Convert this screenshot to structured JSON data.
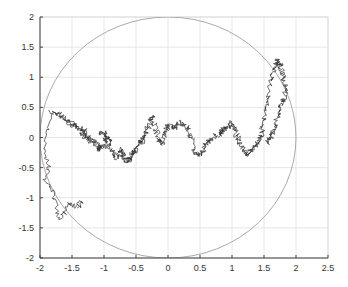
{
  "chart_data": {
    "type": "line",
    "title": "",
    "xlabel": "",
    "ylabel": "",
    "xlim": [
      -2,
      2.5
    ],
    "ylim": [
      -2,
      2
    ],
    "grid": true,
    "legend": null,
    "x_ticks": [
      -2,
      -1.5,
      -1,
      -0.5,
      0,
      0.5,
      1,
      1.5,
      2,
      2.5
    ],
    "x_tick_labels": [
      "-2",
      "-1.5",
      "-1",
      "-0.5",
      "0",
      "0.5",
      "1",
      "1.5",
      "2",
      "2.5"
    ],
    "y_ticks": [
      -2,
      -1.5,
      -1,
      -0.5,
      0,
      0.5,
      1,
      1.5,
      2
    ],
    "y_tick_labels": [
      "-2",
      "-1.5",
      "-1",
      "-0.5",
      "0",
      "0.5",
      "1",
      "1.5",
      "2"
    ],
    "series": [
      {
        "name": "circle",
        "kind": "circle",
        "center": [
          0,
          0
        ],
        "radius": 2,
        "color": "#aaaaaa"
      },
      {
        "name": "random-walk",
        "kind": "path",
        "color": "#333333",
        "x": [
          -1.82,
          -1.7,
          -1.6,
          -1.55,
          -1.45,
          -1.4,
          -1.3,
          -1.35,
          -1.25,
          -1.2,
          -1.15,
          -1.05,
          -1.1,
          -1.0,
          -0.95,
          -1.05,
          -0.9,
          -0.95,
          -0.85,
          -0.8,
          -0.75,
          -0.7,
          -0.65,
          -0.6,
          -0.55,
          -0.5,
          -0.45,
          -0.4,
          -0.35,
          -0.3,
          -0.25,
          -0.2,
          -0.15,
          -0.1,
          -0.05,
          0.0,
          0.1,
          0.2,
          0.3,
          0.35,
          0.4,
          0.5,
          0.55,
          0.6,
          0.7,
          0.8,
          0.85,
          0.9,
          1.0,
          1.05,
          1.1,
          1.2,
          1.25,
          1.3,
          1.4,
          1.45,
          1.5,
          1.55,
          1.6,
          1.65,
          1.7,
          1.75,
          1.8,
          1.85,
          1.8,
          1.75,
          1.7,
          1.65,
          1.6,
          1.55
        ],
        "y": [
          0.42,
          0.38,
          0.3,
          0.25,
          0.2,
          0.15,
          0.1,
          0.05,
          0.0,
          -0.05,
          -0.1,
          -0.15,
          -0.2,
          -0.1,
          0.05,
          0.1,
          -0.05,
          -0.15,
          -0.25,
          -0.35,
          -0.2,
          -0.3,
          -0.4,
          -0.35,
          -0.25,
          -0.2,
          -0.1,
          -0.05,
          0.05,
          0.2,
          0.35,
          0.2,
          0.0,
          -0.1,
          0.1,
          0.2,
          0.15,
          0.25,
          0.15,
          0.05,
          -0.25,
          -0.3,
          -0.2,
          -0.1,
          0.0,
          0.05,
          0.1,
          0.15,
          0.25,
          0.1,
          -0.05,
          -0.2,
          -0.3,
          -0.2,
          -0.1,
          0.0,
          0.3,
          0.6,
          0.9,
          1.1,
          1.3,
          1.2,
          1.0,
          0.8,
          0.6,
          0.5,
          0.3,
          0.1,
          0.0,
          -0.1
        ]
      }
    ]
  }
}
